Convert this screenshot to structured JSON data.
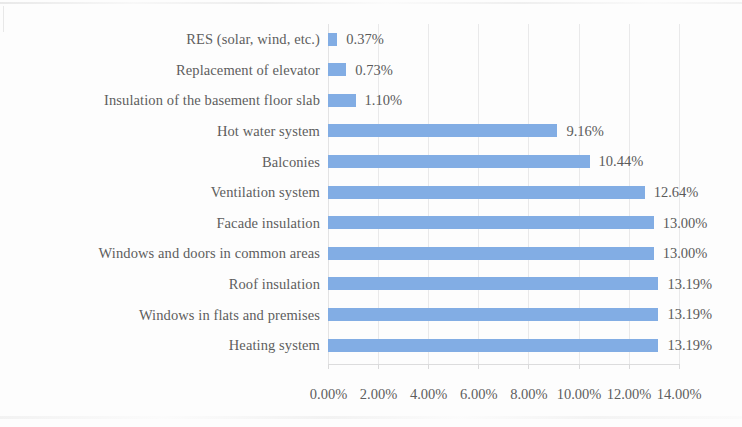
{
  "chart_data": {
    "type": "bar",
    "orientation": "horizontal",
    "title": "",
    "subtitle": "",
    "xlabel": "",
    "ylabel": "",
    "xlim": [
      0,
      14
    ],
    "xtick_labels": [
      "0.00%",
      "2.00%",
      "4.00%",
      "6.00%",
      "8.00%",
      "10.00%",
      "12.00%",
      "14.00%"
    ],
    "xtick_values": [
      0,
      2,
      4,
      6,
      8,
      10,
      12,
      14
    ],
    "grid": true,
    "legend": null,
    "bar_color": "#82ADE4",
    "label_color": "#5e5e5e",
    "gridline_color": "#e9e9ea",
    "categories": [
      "RES (solar, wind, etc.)",
      "Replacement of elevator",
      "Insulation of the basement floor slab",
      "Hot water system",
      "Balconies",
      "Ventilation system",
      "Facade insulation",
      "Windows and doors in common areas",
      "Roof insulation",
      "Windows in flats and premises",
      "Heating system"
    ],
    "values": [
      0.37,
      0.73,
      1.1,
      9.16,
      10.44,
      12.64,
      13.0,
      13.0,
      13.19,
      13.19,
      13.19
    ],
    "value_labels": [
      "0.37%",
      "0.73%",
      "1.10%",
      "9.16%",
      "10.44%",
      "12.64%",
      "13.00%",
      "13.00%",
      "13.19%",
      "13.19%",
      "13.19%"
    ]
  }
}
